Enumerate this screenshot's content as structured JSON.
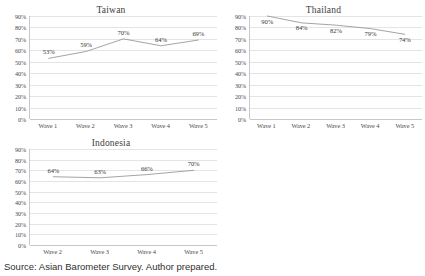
{
  "source_note": "Source: Asian Barometer Survey. Author prepared.",
  "axis": {
    "y_ticks": [
      "90%",
      "80%",
      "70%",
      "60%",
      "50%",
      "40%",
      "30%",
      "20%",
      "10%",
      "0%"
    ]
  },
  "chart_data": [
    {
      "type": "line",
      "title": "Taiwan",
      "categories": [
        "Wave 1",
        "Wave 2",
        "Wave 3",
        "Wave 4",
        "Wave 5"
      ],
      "values": [
        53,
        59,
        70,
        64,
        69
      ],
      "point_labels": [
        "53%",
        "59%",
        "70%",
        "64%",
        "69%"
      ],
      "xlabel": "",
      "ylabel": "",
      "ylim": [
        0,
        90
      ],
      "ytick_values": [
        90,
        80,
        70,
        60,
        50,
        40,
        30,
        20,
        10,
        0
      ],
      "ytick_labels": [
        "90%",
        "80%",
        "70%",
        "60%",
        "50%",
        "40%",
        "30%",
        "20%",
        "10%",
        "0%"
      ],
      "grid": true,
      "legend": false,
      "line_color": "#9a9a9a"
    },
    {
      "type": "line",
      "title": "Thailand",
      "categories": [
        "Wave 1",
        "Wave 2",
        "Wave 3",
        "Wave 4",
        "Wave 5"
      ],
      "values": [
        90,
        84,
        82,
        79,
        74
      ],
      "point_labels": [
        "90%",
        "84%",
        "82%",
        "79%",
        "74%"
      ],
      "xlabel": "",
      "ylabel": "",
      "ylim": [
        0,
        90
      ],
      "ytick_values": [
        90,
        80,
        70,
        60,
        50,
        40,
        30,
        20,
        10,
        0
      ],
      "ytick_labels": [
        "90%",
        "80%",
        "70%",
        "60%",
        "50%",
        "40%",
        "30%",
        "20%",
        "10%",
        "0%"
      ],
      "grid": true,
      "legend": false,
      "line_color": "#9a9a9a"
    },
    {
      "type": "line",
      "title": "Indonesia",
      "categories": [
        "Wave 2",
        "Wave 3",
        "Wave 4",
        "Wave 5"
      ],
      "values": [
        64,
        63,
        66,
        70
      ],
      "point_labels": [
        "64%",
        "63%",
        "66%",
        "70%"
      ],
      "xlabel": "",
      "ylabel": "",
      "ylim": [
        0,
        90
      ],
      "ytick_values": [
        90,
        80,
        70,
        60,
        50,
        40,
        30,
        20,
        10,
        0
      ],
      "ytick_labels": [
        "90%",
        "80%",
        "70%",
        "60%",
        "50%",
        "40%",
        "30%",
        "20%",
        "10%",
        "0%"
      ],
      "grid": true,
      "legend": false,
      "line_color": "#9a9a9a"
    }
  ]
}
